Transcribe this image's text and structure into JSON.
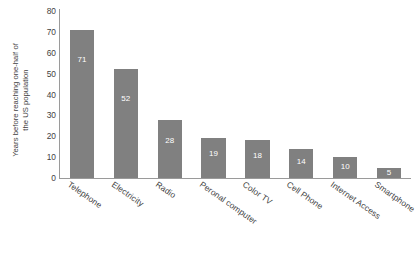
{
  "chart_data": {
    "type": "bar",
    "title": "",
    "subtitle": "",
    "xlabel": "",
    "ylabel": "Years before reaching one-half of the US population",
    "ylabel_lines": [
      "Years before reaching one-half of",
      "the US population"
    ],
    "categories": [
      "Telephone",
      "Electricity",
      "Radio",
      "Peronal computer",
      "Color TV",
      "Cell Phone",
      "Internet Access",
      "Smartphone"
    ],
    "values": [
      71,
      52,
      28,
      19,
      18,
      14,
      10,
      5
    ],
    "value_labels": [
      "71",
      "52",
      "28",
      "19",
      "18",
      "14",
      "10",
      "5"
    ],
    "ylim": [
      0,
      80
    ],
    "yticks": [
      0,
      10,
      20,
      30,
      40,
      50,
      60,
      70,
      80
    ],
    "ytick_labels": [
      "0",
      "10",
      "20",
      "30",
      "40",
      "50",
      "60",
      "70",
      "80"
    ],
    "grid": false,
    "legend": false,
    "legend_position": "none",
    "bar_color": "#808080",
    "value_label_color": "#ffffff",
    "axis_color": "#9a9a9a",
    "text_color": "#3f3f3f",
    "background_color": "#ffffff"
  }
}
